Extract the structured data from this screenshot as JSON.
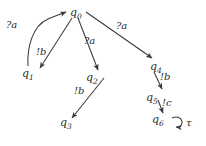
{
  "diagram": {
    "type": "state-transition-automaton",
    "stroke_color": "#3a3a3a",
    "text_color": "#2b2b2b",
    "background_color": "#ffffff",
    "states": [
      {
        "id": "q0",
        "name": "q",
        "index": "0",
        "x": 70,
        "y": 7
      },
      {
        "id": "q1",
        "name": "q",
        "index": "1",
        "x": 22,
        "y": 68
      },
      {
        "id": "q2",
        "name": "q",
        "index": "2",
        "x": 86,
        "y": 72
      },
      {
        "id": "q3",
        "name": "q",
        "index": "3",
        "x": 60,
        "y": 117
      },
      {
        "id": "q4",
        "name": "q",
        "index": "4",
        "x": 150,
        "y": 61
      },
      {
        "id": "q5",
        "name": "q",
        "index": "5",
        "x": 146,
        "y": 92
      },
      {
        "id": "q6",
        "name": "q",
        "index": "6",
        "x": 152,
        "y": 114
      }
    ],
    "transitions": [
      {
        "id": "t-in-q0",
        "from": "",
        "to": "q0",
        "label": "?a",
        "label_x": 6,
        "label_y": 20,
        "shape": "curve"
      },
      {
        "id": "t-q0-q1",
        "from": "q0",
        "to": "q1",
        "label": "!b",
        "label_x": 36,
        "label_y": 47,
        "shape": "line"
      },
      {
        "id": "t-q0-q2",
        "from": "q0",
        "to": "q2",
        "label": "?a",
        "label_x": 84,
        "label_y": 36,
        "shape": "line"
      },
      {
        "id": "t-q0-q4",
        "from": "q0",
        "to": "q4",
        "label": "?a",
        "label_x": 116,
        "label_y": 21,
        "shape": "line"
      },
      {
        "id": "t-q2-q3",
        "from": "q2",
        "to": "q3",
        "label": "!b",
        "label_x": 74,
        "label_y": 86,
        "shape": "line"
      },
      {
        "id": "t-q4-q5",
        "from": "q4",
        "to": "q5",
        "label": "!b",
        "label_x": 160,
        "label_y": 72,
        "shape": "line"
      },
      {
        "id": "t-q5-q6",
        "from": "q5",
        "to": "q6",
        "label": "!c",
        "label_x": 162,
        "label_y": 98,
        "shape": "line"
      },
      {
        "id": "t-q6-q6",
        "from": "q6",
        "to": "q6",
        "label": "τ",
        "label_x": 186,
        "label_y": 118,
        "shape": "self-loop"
      }
    ]
  }
}
